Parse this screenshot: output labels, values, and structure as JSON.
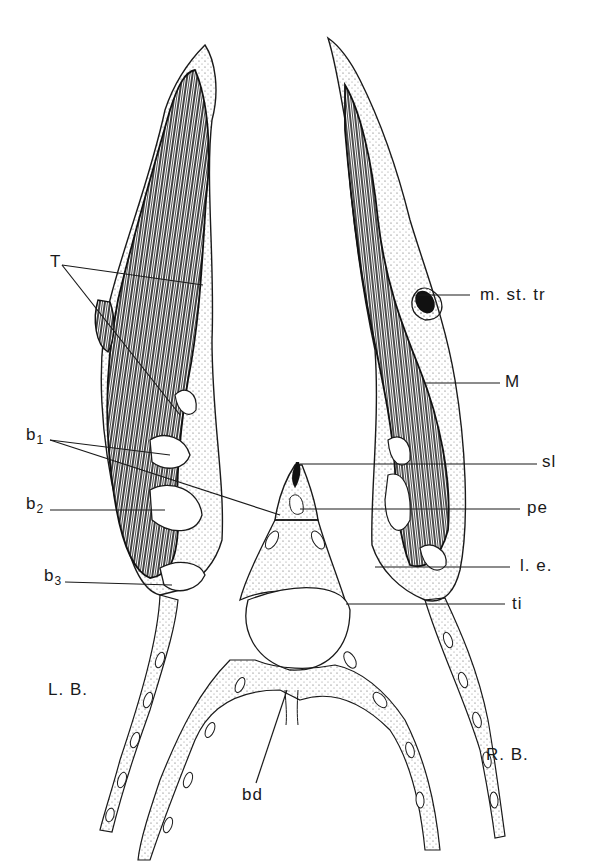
{
  "figure": {
    "type": "anatomical line drawing (cross-section)",
    "colors": {
      "ink": "#1a1a1a",
      "background": "#ffffff",
      "stipple": "#555555"
    }
  },
  "labels": {
    "T": "T",
    "b1_base": "b",
    "b1_sub": "1",
    "b2_base": "b",
    "b2_sub": "2",
    "b3_base": "b",
    "b3_sub": "3",
    "LB": "L. B.",
    "m_st_tr": "m. st. tr",
    "M": "M",
    "sl": "sl",
    "pe": "pe",
    "le": "l. e.",
    "ti": "ti",
    "RB": "R. B.",
    "bd": "bd"
  }
}
